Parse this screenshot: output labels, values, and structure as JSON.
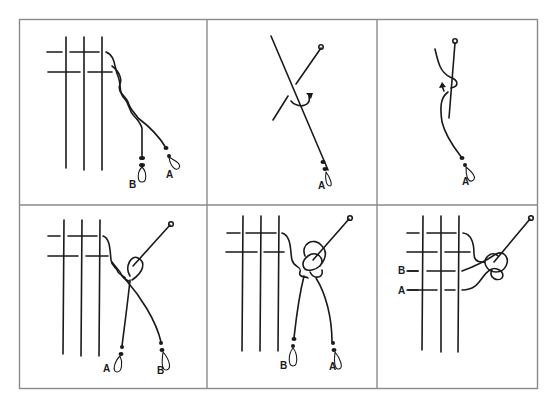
{
  "figure": {
    "grid": {
      "rows": 2,
      "cols": 3
    },
    "colors": {
      "ink": "#1a1a1a",
      "border": "#8a8a8a",
      "background": "#ffffff"
    },
    "panels": [
      {
        "id": 1,
        "step": "twist two strands A and B below weave",
        "labels": [
          "B",
          "A"
        ]
      },
      {
        "id": 2,
        "step": "strand A crossed over pin with wrap arrow",
        "labels": [
          "A"
        ]
      },
      {
        "id": 3,
        "step": "strand A looped around pin, arrow upward",
        "labels": [
          "A"
        ]
      },
      {
        "id": 4,
        "step": "twisted strands looped around pin",
        "labels": [
          "A",
          "B"
        ]
      },
      {
        "id": 5,
        "step": "strands wrapped around pin forming knot",
        "labels": [
          "B",
          "A"
        ]
      },
      {
        "id": 6,
        "step": "finished knot woven back into grid",
        "labels": [
          "B",
          "A"
        ]
      }
    ]
  }
}
